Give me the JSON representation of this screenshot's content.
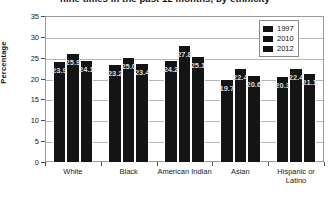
{
  "chart_data": {
    "type": "bar",
    "title": "nine times in the past 12 months, by ethnicity",
    "xlabel": "",
    "ylabel": "Percentage",
    "ylim": [
      0,
      35
    ],
    "yticks": [
      0,
      5,
      10,
      15,
      20,
      25,
      30,
      35
    ],
    "grid": true,
    "legend_position": "upper right",
    "categories": [
      "White",
      "Black",
      "American Indian",
      "Asian",
      "Hispanic or Latino"
    ],
    "series": [
      {
        "name": "1997",
        "color": "#141414",
        "values": [
          23.9,
          23.2,
          24.2,
          19.7,
          20.3
        ],
        "labels": [
          "23.9",
          "23.2",
          "24.2",
          "19.7",
          "20.3"
        ]
      },
      {
        "name": "2010",
        "color": "#141414",
        "values": [
          25.9,
          25.0,
          27.8,
          22.4,
          22.4
        ],
        "labels": [
          "25.9",
          "25.0",
          "27.8",
          "22.4",
          "22.4"
        ]
      },
      {
        "name": "2012",
        "color": "#141414",
        "values": [
          24.1,
          23.4,
          25.1,
          20.6,
          21.1
        ],
        "labels": [
          "24.1",
          "23.4",
          "25.1",
          "20.6",
          "21.1"
        ]
      }
    ]
  },
  "legend": {
    "entries": [
      {
        "label": "1997"
      },
      {
        "label": "2010"
      },
      {
        "label": "2012"
      }
    ]
  }
}
